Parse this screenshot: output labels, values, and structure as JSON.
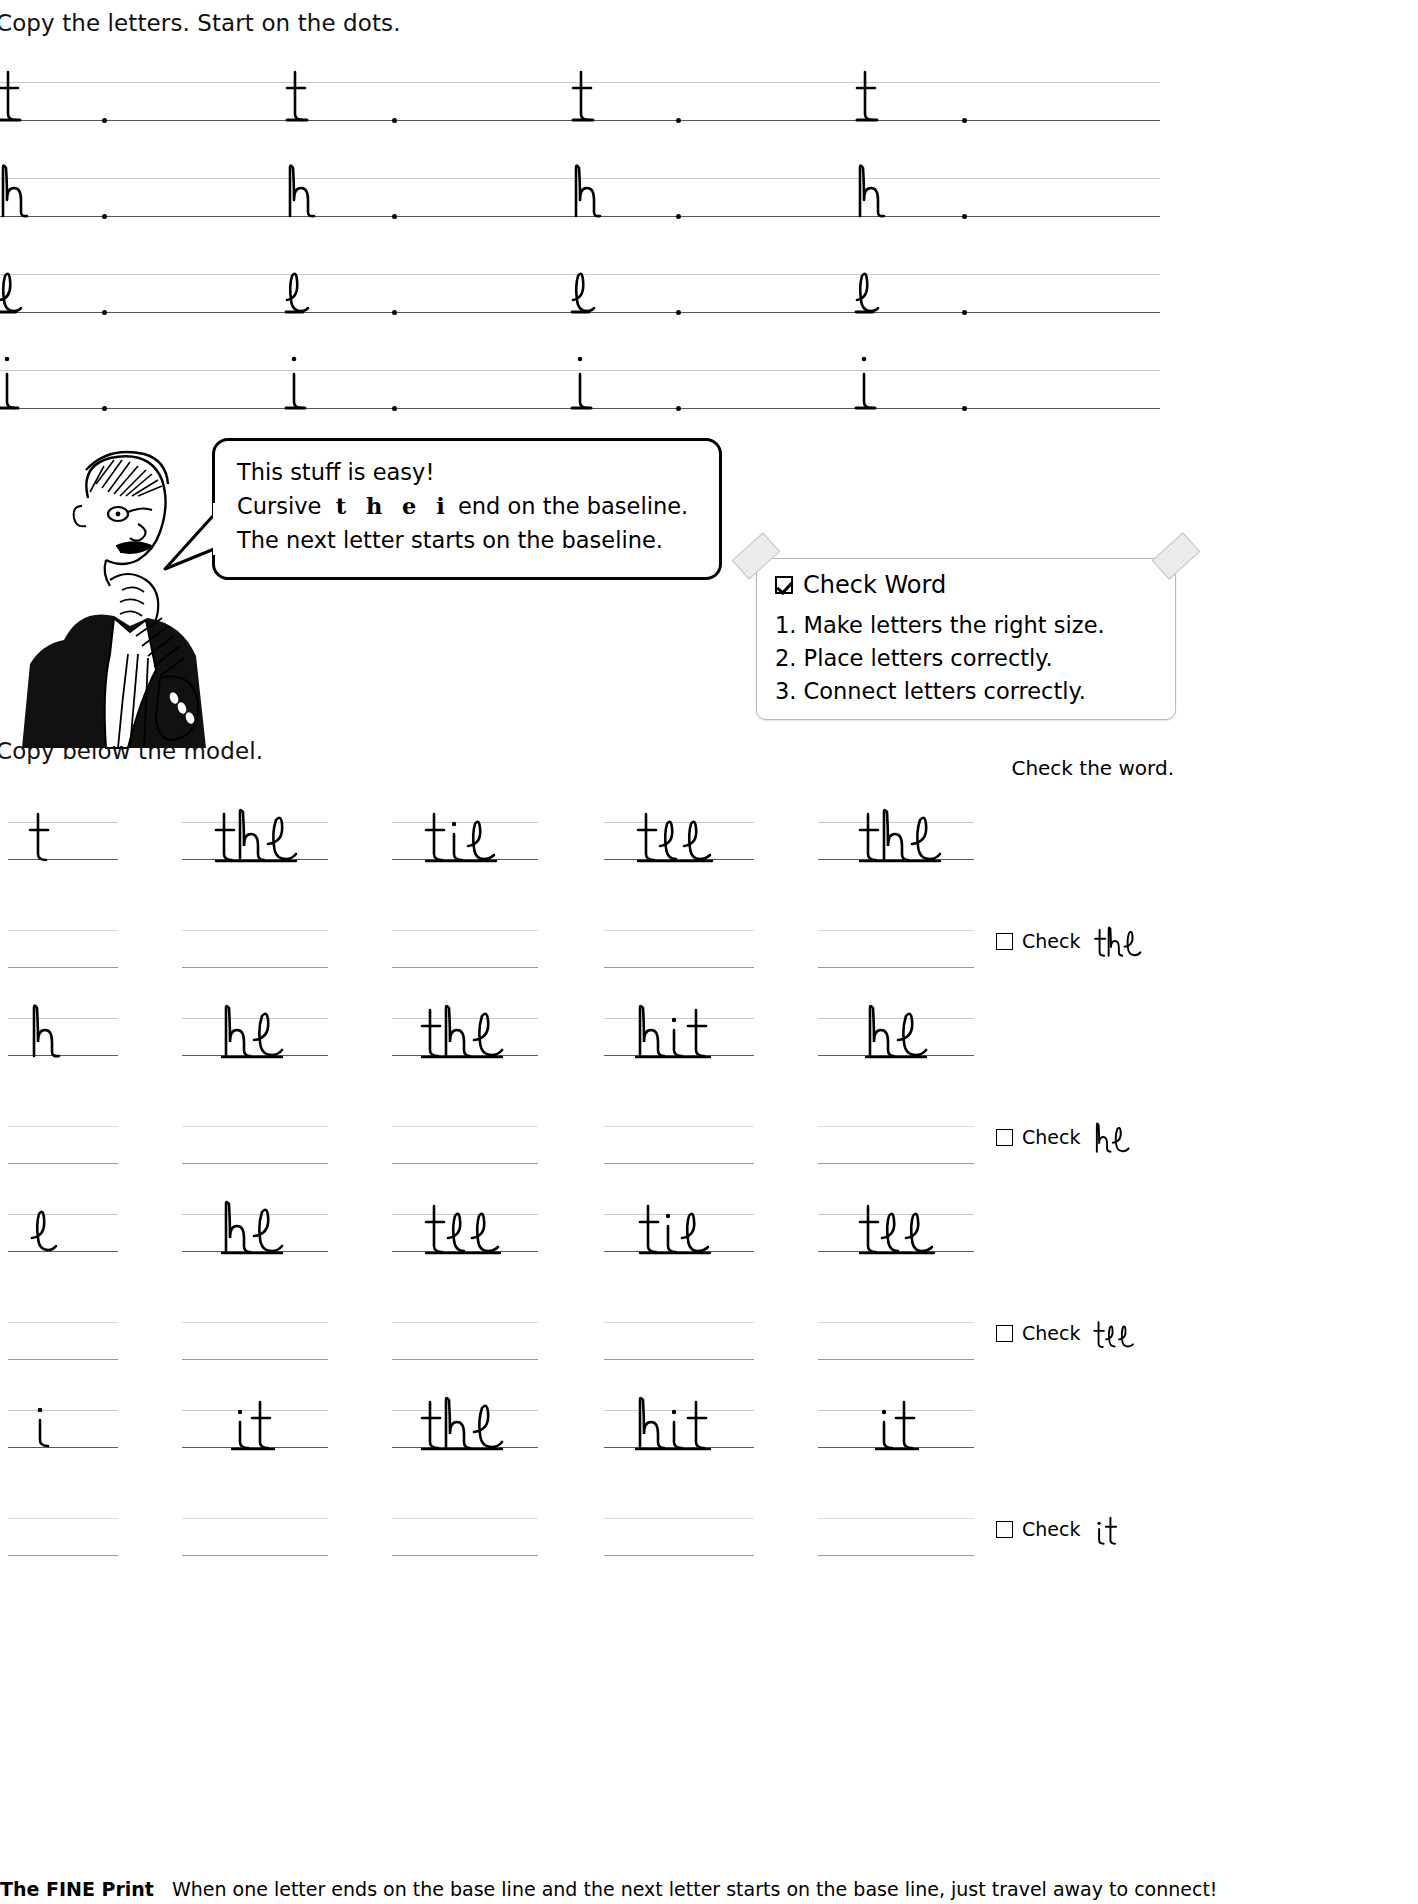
{
  "worksheet": {
    "instruction_top": "Copy the letters. Start on the dots.",
    "instruction_middle": "Copy below the model.",
    "instruction_right": "Check the word.",
    "fine_print_label": "The FINE Print",
    "fine_print_body": "When one letter ends on the base line and the next letter starts on the base line, just travel away to connect!"
  },
  "letter_practice": {
    "rows": [
      {
        "letter": "t",
        "repeats": 4,
        "dots": 4
      },
      {
        "letter": "h",
        "repeats": 4,
        "dots": 4
      },
      {
        "letter": "e",
        "repeats": 4,
        "dots": 4
      },
      {
        "letter": "i",
        "repeats": 4,
        "dots": 4
      }
    ]
  },
  "speech_bubble": {
    "line1": "This stuff is easy!",
    "line2_prefix": "Cursive",
    "line2_letters": "t  h  e  i",
    "line2_suffix": "end on the baseline.",
    "line3": "The next letter starts on the baseline."
  },
  "check_word_card": {
    "title": "Check Word",
    "checkbox_state": "checked",
    "items": [
      "1. Make letters the right size.",
      "2. Place letters correctly.",
      "3. Connect letters correctly."
    ]
  },
  "word_practice": {
    "rows": [
      {
        "model_letter": "t",
        "words": [
          "the",
          "tie",
          "tee",
          "the"
        ],
        "check_label": "Check",
        "check_word": "the",
        "check_state": "unchecked"
      },
      {
        "model_letter": "h",
        "words": [
          "he",
          "the",
          "hit",
          "he"
        ],
        "check_label": "Check",
        "check_word": "he",
        "check_state": "unchecked"
      },
      {
        "model_letter": "e",
        "words": [
          "he",
          "tee",
          "tie",
          "tee"
        ],
        "check_label": "Check",
        "check_word": "tee",
        "check_state": "unchecked"
      },
      {
        "model_letter": "i",
        "words": [
          "it",
          "the",
          "hit",
          "it"
        ],
        "check_label": "Check",
        "check_word": "it",
        "check_state": "unchecked"
      }
    ]
  },
  "colors": {
    "baseline": "#5a5a5a",
    "midline": "#c7c7c7",
    "ink": "#000000",
    "card_border": "#b9b9b9",
    "tape": "#ececec"
  }
}
